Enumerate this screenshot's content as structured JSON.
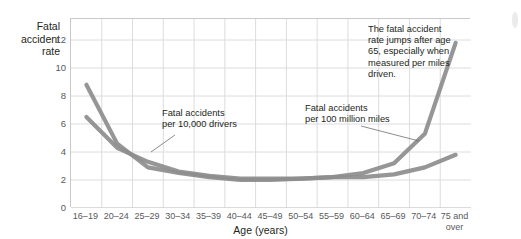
{
  "chart_data": {
    "type": "line",
    "title": "",
    "xlabel": "Age (years)",
    "ylabel": "Fatal accident rate",
    "ylabel_lines": [
      "Fatal",
      "accident",
      "rate"
    ],
    "categories": [
      "16–19",
      "20–24",
      "25–29",
      "30–34",
      "35–39",
      "40–44",
      "45–49",
      "50–54",
      "55–59",
      "60–64",
      "65–69",
      "70–74",
      "75 and over"
    ],
    "categories_display": [
      [
        "16–19"
      ],
      [
        "20–24"
      ],
      [
        "25–29"
      ],
      [
        "30–34"
      ],
      [
        "35–39"
      ],
      [
        "40–44"
      ],
      [
        "45–49"
      ],
      [
        "50–54"
      ],
      [
        "55–59"
      ],
      [
        "60–64"
      ],
      [
        "65–69"
      ],
      [
        "70–74"
      ],
      [
        "75 and",
        "over"
      ]
    ],
    "yticks": [
      0,
      2,
      4,
      6,
      8,
      10,
      12
    ],
    "ylim": [
      0,
      13.5
    ],
    "grid": true,
    "legend_position": "none",
    "series": [
      {
        "name": "Fatal accidents per 100 million miles",
        "color": "#8d8d8d",
        "values": [
          8.8,
          4.6,
          2.9,
          2.5,
          2.2,
          2.0,
          2.0,
          2.1,
          2.2,
          2.5,
          3.2,
          5.3,
          11.8
        ]
      },
      {
        "name": "Fatal accidents per 10,000 drivers",
        "color": "#8d8d8d",
        "values": [
          6.5,
          4.3,
          3.3,
          2.6,
          2.3,
          2.1,
          2.1,
          2.1,
          2.2,
          2.2,
          2.4,
          2.9,
          3.8
        ]
      }
    ],
    "annotations": [
      {
        "id": "drivers",
        "lines": [
          "Fatal accidents",
          "per 10,000 drivers"
        ],
        "leader": true
      },
      {
        "id": "miles",
        "lines": [
          "Fatal accidents",
          "per 100 million miles"
        ],
        "leader": true
      },
      {
        "id": "jump",
        "lines": [
          "The fatal accident",
          "rate jumps after age",
          "65, especially when",
          "measured per miles",
          "driven."
        ],
        "leader": false
      }
    ]
  },
  "style": {
    "line_color": "#8d8d8d",
    "grid_color": "#dcdcdc",
    "axis_color": "#c9c9c9",
    "tick_text_color": "#58595b",
    "label_text_color": "#231f20",
    "background": "#ffffff"
  }
}
